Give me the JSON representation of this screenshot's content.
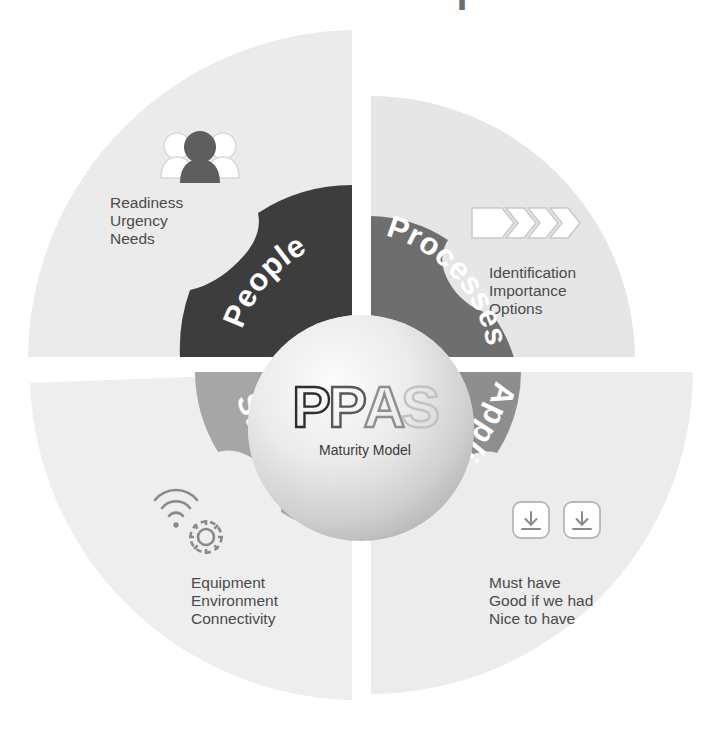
{
  "diagram": {
    "title_partial": "l",
    "center": {
      "acronym_letters": [
        "P",
        "P",
        "A",
        "S"
      ],
      "acronym": "PPAS",
      "subtitle": "Maturity Model"
    },
    "quadrants": [
      {
        "id": "people",
        "label": "People",
        "band_color": "#3d3d3d",
        "wedge_color": "#ebebeb",
        "icon": "people-group-icon",
        "bullets": [
          "Readiness",
          "Urgency",
          "Needs"
        ]
      },
      {
        "id": "processes",
        "label": "Processes",
        "band_color": "#6e6e6e",
        "wedge_color": "#e6e6e6",
        "icon": "process-chevrons-icon",
        "bullets": [
          "Identification",
          "Importance",
          "Options"
        ]
      },
      {
        "id": "structure",
        "label": "Structure",
        "band_color": "#a6a6a6",
        "wedge_color": "#eeeeee",
        "icon": "wifi-gear-icon",
        "bullets": [
          "Equipment",
          "Environment",
          "Connectivity"
        ]
      },
      {
        "id": "application",
        "label": "Application",
        "band_color": "#8e8e8e",
        "wedge_color": "#ececec",
        "icon": "download-boxes-icon",
        "bullets": [
          "Must have",
          "Good if we had",
          "Nice to have"
        ]
      }
    ],
    "colors": {
      "background": "#ffffff",
      "text": "#4a4a4a",
      "band_dark": "#3d3d3d",
      "band_mid_dark": "#6e6e6e",
      "band_mid": "#8e8e8e",
      "band_light": "#a6a6a6"
    }
  }
}
